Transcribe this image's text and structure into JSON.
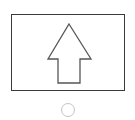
{
  "upload_card": {
    "icon": "upload-arrow-icon",
    "frame_color": "#3a3a3a",
    "arrow_color": "#555555"
  },
  "selector": {
    "icon": "radio-circle-icon",
    "selected": false,
    "color": "#c4c4c4"
  }
}
